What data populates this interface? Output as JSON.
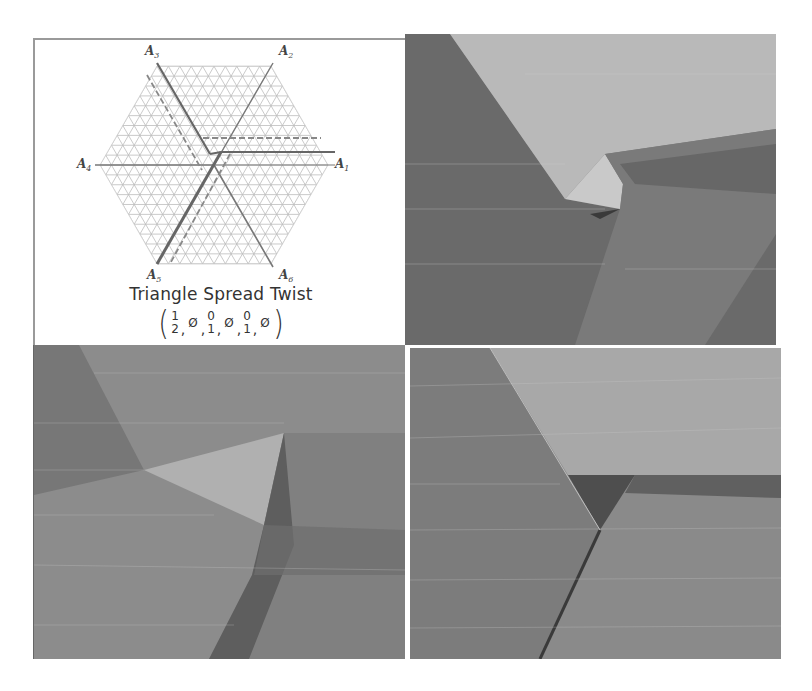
{
  "figure": {
    "diagram_panel": {
      "axes": [
        {
          "id": "A1",
          "label": "A",
          "sub": "1"
        },
        {
          "id": "A2",
          "label": "A",
          "sub": "2"
        },
        {
          "id": "A3",
          "label": "A",
          "sub": "3"
        },
        {
          "id": "A4",
          "label": "A",
          "sub": "4"
        },
        {
          "id": "A5",
          "label": "A",
          "sub": "5"
        },
        {
          "id": "A6",
          "label": "A",
          "sub": "6"
        }
      ],
      "title": "Triangle Spread Twist",
      "tuple": {
        "open": "(",
        "close": ")",
        "entries": [
          {
            "type": "frac",
            "top": "1",
            "bottom": "2"
          },
          {
            "type": "empty",
            "value": "Ø"
          },
          {
            "type": "frac",
            "top": "0",
            "bottom": "1"
          },
          {
            "type": "empty",
            "value": "Ø"
          },
          {
            "type": "frac",
            "top": "0",
            "bottom": "1"
          },
          {
            "type": "empty",
            "value": "Ø"
          }
        ],
        "separator": ","
      },
      "colors": {
        "grid": "#b8b8b8",
        "axis": "#777777",
        "fold": "#6a6a6a",
        "dashed": "#8a8a8a"
      }
    },
    "photos": [
      {
        "id": "photo-top-right",
        "description": "folded paper triangle spread twist, oblique view"
      },
      {
        "id": "photo-bottom-left",
        "description": "folded paper twist, side lighting"
      },
      {
        "id": "photo-bottom-right",
        "description": "folded paper pleat, dashed border"
      }
    ]
  }
}
